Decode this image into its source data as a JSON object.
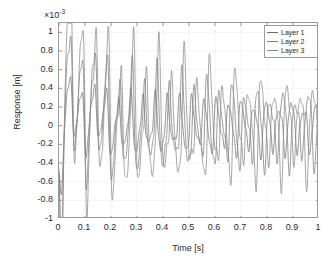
{
  "chart_data": {
    "type": "line",
    "title": "",
    "xlabel": "Time [s]",
    "ylabel": "Response [m]",
    "y_multiplier_text": "×10",
    "y_multiplier_exponent": "-3",
    "y_multiplier_value": 0.001,
    "xlim": [
      0,
      1
    ],
    "ylim": [
      -1,
      1.1
    ],
    "grid": true,
    "legend_position": "top-right",
    "xticks": [
      0,
      0.1,
      0.2,
      0.3,
      0.4,
      0.5,
      0.6,
      0.7,
      0.8,
      0.9,
      1
    ],
    "xtick_labels": [
      "0",
      "0.1",
      "0.2",
      "0.3",
      "0.4",
      "0.5",
      "0.6",
      "0.7",
      "0.8",
      "0.9",
      "1"
    ],
    "yticks": [
      -1,
      -0.8,
      -0.6,
      -0.4,
      -0.2,
      0,
      0.2,
      0.4,
      0.6,
      0.8,
      1
    ],
    "ytick_labels": [
      "-1",
      "-0.8",
      "-0.6",
      "-0.4",
      "-0.2",
      "0",
      "0.2",
      "0.4",
      "0.6",
      "0.8",
      "1"
    ],
    "axis_color": "#9a9a9a",
    "grid_color": "#d8d8d8",
    "background_color": "#ffffff",
    "series": [
      {
        "name": "Layer 1",
        "color": "#6f6f6f",
        "amp0": 0.3,
        "decay": 0.55,
        "freq": 21.0,
        "phase": 3.05,
        "beat_amp": 0.22,
        "beat_freq": 10.0,
        "beat_phase": 0.7,
        "impulse": -0.72,
        "impulse_decay": 46,
        "peak_value": 0.43,
        "steady_amplitude": 0.22
      },
      {
        "name": "Layer 2",
        "color": "#7b7b7b",
        "amp0": 0.62,
        "decay": 0.62,
        "freq": 20.6,
        "phase": 3.1,
        "beat_amp": 0.3,
        "beat_freq": 10.2,
        "beat_phase": 0.5,
        "impulse": -0.95,
        "impulse_decay": 44,
        "peak_value": 0.75,
        "steady_amplitude": 0.28
      },
      {
        "name": "Layer 3",
        "color": "#888888",
        "amp0": 0.92,
        "decay": 0.7,
        "freq": 20.2,
        "phase": 3.14,
        "beat_amp": 0.36,
        "beat_freq": 10.4,
        "beat_phase": 0.3,
        "impulse": -1.02,
        "impulse_decay": 42,
        "peak_value": 1.05,
        "steady_amplitude": 0.35
      }
    ],
    "annotations": [
      {
        "text": "peak response ≈ 1.05e-3 m near t = 0.04 s"
      },
      {
        "text": "initial transient dips to ≈ -1e-3 m at t = 0"
      },
      {
        "text": "beating envelope with period ≈ 0.1 s"
      },
      {
        "text": "steady oscillation amplitude ≈ 0.35e-3 m at t = 1 s"
      }
    ]
  },
  "legend": {
    "items": [
      {
        "label": "Layer 1"
      },
      {
        "label": "Layer 2"
      },
      {
        "label": "Layer 3"
      }
    ]
  }
}
